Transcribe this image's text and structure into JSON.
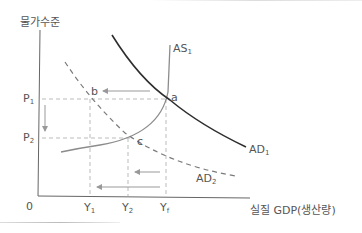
{
  "diagram": {
    "title": "",
    "y_axis_label": "물가수준",
    "x_axis_label": "실질 GDP(생산량)",
    "origin_label": "0",
    "price_ticks": [
      {
        "label": "P",
        "sub": "1"
      },
      {
        "label": "P",
        "sub": "2"
      }
    ],
    "output_ticks": [
      {
        "label": "Y",
        "sub": "1"
      },
      {
        "label": "Y",
        "sub": "2"
      },
      {
        "label": "Y",
        "sub": "f"
      }
    ],
    "curves": [
      {
        "label": "AS",
        "sub": "1",
        "style": "solid",
        "color": "#888888"
      },
      {
        "label": "AD",
        "sub": "1",
        "style": "solid",
        "color": "#333333"
      },
      {
        "label": "AD",
        "sub": "2",
        "style": "dashed",
        "color": "#777777"
      }
    ],
    "points": [
      "a",
      "b",
      "c"
    ],
    "colors": {
      "axis": "#666666",
      "as_curve": "#8c8c8c",
      "ad1_curve": "#2e2e2e",
      "ad2_curve": "#7a7a7a",
      "guides": "#bbbbbb",
      "arrows": "#999999",
      "text": "#555555"
    }
  }
}
